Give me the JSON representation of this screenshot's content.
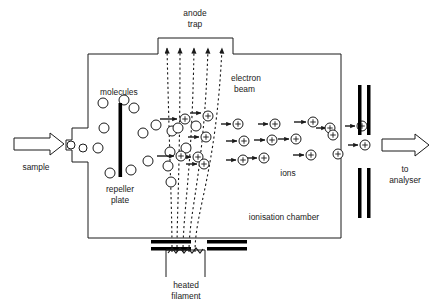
{
  "diagram": {
    "labels": {
      "anode_trap_line1": "anode",
      "anode_trap_line2": "trap",
      "electron_beam_line1": "electron",
      "electron_beam_line2": "beam",
      "molecules": "molecules",
      "repeller_line1": "repeller",
      "repeller_line2": "plate",
      "sample": "sample",
      "ions": "ions",
      "ionisation_chamber": "ionisation chamber",
      "heated_filament_line1": "heated",
      "heated_filament_line2": "filament",
      "to_analyser_line1": "to",
      "to_analyser_line2": "analyser"
    },
    "colors": {
      "stroke": "#1a1a1a",
      "plate_fill": "#000000",
      "background": "#ffffff",
      "label_text": "#1a1a1a"
    },
    "icons": {
      "sample_arrow": "block-arrow-right-icon",
      "analyser_arrow": "block-arrow-right-icon",
      "ion_particle": "plus-circle-icon",
      "molecule_particle": "open-circle-icon",
      "electron_path": "dotted-arrow-up-icon",
      "drift_arrow": "small-arrow-right-icon"
    },
    "chamber": {
      "left_wall_x": 88,
      "right_wall_x": 341,
      "top_y": 54,
      "bottom_y": 238,
      "trap_x1": 158,
      "trap_x2": 233,
      "trap_top_y": 38
    },
    "electron_beam_count": 5,
    "molecules": [
      {
        "cx": 71,
        "cy": 145,
        "r": 4
      },
      {
        "cx": 83,
        "cy": 148,
        "r": 4
      },
      {
        "cx": 103,
        "cy": 103,
        "r": 5
      },
      {
        "cx": 124,
        "cy": 100,
        "r": 5
      },
      {
        "cx": 134,
        "cy": 108,
        "r": 5
      },
      {
        "cx": 104,
        "cy": 128,
        "r": 5
      },
      {
        "cx": 98,
        "cy": 148,
        "r": 5
      },
      {
        "cx": 110,
        "cy": 173,
        "r": 5
      },
      {
        "cx": 131,
        "cy": 170,
        "r": 5
      },
      {
        "cx": 143,
        "cy": 133,
        "r": 5
      },
      {
        "cx": 156,
        "cy": 125,
        "r": 5
      },
      {
        "cx": 148,
        "cy": 161,
        "r": 5
      },
      {
        "cx": 172,
        "cy": 131,
        "r": 5
      },
      {
        "cx": 178,
        "cy": 128,
        "r": 5
      },
      {
        "cx": 170,
        "cy": 152,
        "r": 5
      },
      {
        "cx": 186,
        "cy": 148,
        "r": 5
      },
      {
        "cx": 196,
        "cy": 126,
        "r": 5
      },
      {
        "cx": 168,
        "cy": 166,
        "r": 5
      },
      {
        "cx": 171,
        "cy": 182,
        "r": 5
      }
    ],
    "ions": [
      {
        "cx": 185,
        "cy": 119,
        "r": 5
      },
      {
        "cx": 208,
        "cy": 116,
        "r": 5
      },
      {
        "cx": 206,
        "cy": 137,
        "r": 5
      },
      {
        "cx": 198,
        "cy": 157,
        "r": 5
      },
      {
        "cx": 181,
        "cy": 156,
        "r": 5
      },
      {
        "cx": 204,
        "cy": 164,
        "r": 5
      },
      {
        "cx": 238,
        "cy": 124,
        "r": 5
      },
      {
        "cx": 244,
        "cy": 141,
        "r": 5
      },
      {
        "cx": 243,
        "cy": 160,
        "r": 5
      },
      {
        "cx": 275,
        "cy": 124,
        "r": 5
      },
      {
        "cx": 272,
        "cy": 140,
        "r": 5
      },
      {
        "cx": 264,
        "cy": 158,
        "r": 5
      },
      {
        "cx": 296,
        "cy": 139,
        "r": 5
      },
      {
        "cx": 313,
        "cy": 122,
        "r": 5
      },
      {
        "cx": 311,
        "cy": 155,
        "r": 5
      },
      {
        "cx": 330,
        "cy": 128,
        "r": 5
      },
      {
        "cx": 333,
        "cy": 135,
        "r": 5
      },
      {
        "cx": 338,
        "cy": 154,
        "r": 5
      },
      {
        "cx": 362,
        "cy": 126,
        "r": 5
      },
      {
        "cx": 365,
        "cy": 145,
        "r": 5
      }
    ],
    "acceleration_plates": [
      {
        "x": 358,
        "y": 85,
        "w": 3.5,
        "h": 50
      },
      {
        "x": 367,
        "y": 85,
        "w": 3.5,
        "h": 50
      },
      {
        "x": 358,
        "y": 168,
        "w": 3.5,
        "h": 50
      },
      {
        "x": 367,
        "y": 168,
        "w": 3.5,
        "h": 50
      }
    ],
    "filament_bars": [
      {
        "x": 151,
        "y": 240,
        "w": 40,
        "h": 3.5
      },
      {
        "x": 151,
        "y": 247,
        "w": 40,
        "h": 3.5
      },
      {
        "x": 207,
        "y": 240,
        "w": 40,
        "h": 3.5
      },
      {
        "x": 207,
        "y": 247,
        "w": 40,
        "h": 3.5
      }
    ]
  }
}
